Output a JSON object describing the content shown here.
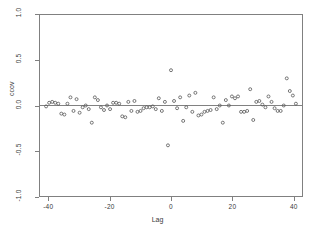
{
  "chart_data": {
    "type": "scatter",
    "title": "",
    "xlabel": "Lag",
    "ylabel": "ccov",
    "xlim": [
      -43,
      43
    ],
    "ylim": [
      -1.0,
      1.0
    ],
    "xticks": [
      -40,
      -20,
      0,
      20,
      40
    ],
    "xtick_labels": [
      "-40",
      "-20",
      "0",
      "20",
      "40"
    ],
    "yticks": [
      -1.0,
      -0.5,
      0.0,
      0.5,
      1.0
    ],
    "ytick_labels": [
      "-1.0",
      "-0.5",
      "0.0",
      "0.5",
      "1.0"
    ],
    "grid": false,
    "legend": null,
    "marker": "open-circle",
    "marker_color": "#555555",
    "reference_line": {
      "orientation": "horizontal",
      "y": 0.0,
      "color": "#808080"
    },
    "series": [
      {
        "name": "ccov",
        "x": [
          -41,
          -40,
          -39,
          -38,
          -37,
          -36,
          -35,
          -34,
          -33,
          -32,
          -31,
          -30,
          -29,
          -28,
          -27,
          -26,
          -25,
          -24,
          -23,
          -22,
          -21,
          -20,
          -19,
          -18,
          -17,
          -16,
          -15,
          -14,
          -13,
          -12,
          -11,
          -10,
          -9,
          -8,
          -7,
          -6,
          -5,
          -4,
          -3,
          -2,
          -1,
          0,
          1,
          2,
          3,
          4,
          5,
          6,
          7,
          8,
          9,
          10,
          11,
          12,
          13,
          14,
          15,
          16,
          17,
          18,
          19,
          20,
          21,
          22,
          23,
          24,
          25,
          26,
          27,
          28,
          29,
          30,
          31,
          32,
          33,
          34,
          35,
          36,
          37,
          38,
          39,
          40,
          41
        ],
        "y": [
          -0.01,
          0.03,
          0.04,
          0.03,
          0.02,
          -0.09,
          -0.1,
          0.02,
          0.09,
          -0.06,
          0.07,
          -0.08,
          -0.02,
          0.0,
          -0.04,
          -0.19,
          0.09,
          0.06,
          -0.02,
          -0.05,
          0.0,
          -0.04,
          0.03,
          0.03,
          0.02,
          -0.12,
          -0.13,
          0.04,
          -0.06,
          0.05,
          -0.07,
          -0.06,
          -0.03,
          -0.02,
          -0.02,
          -0.01,
          -0.04,
          0.08,
          -0.06,
          0.04,
          -0.44,
          0.39,
          0.05,
          -0.03,
          0.09,
          -0.17,
          -0.02,
          0.11,
          -0.07,
          0.14,
          -0.11,
          -0.1,
          -0.07,
          -0.06,
          -0.05,
          0.09,
          -0.04,
          0.0,
          -0.19,
          0.06,
          0.0,
          0.1,
          0.08,
          0.1,
          -0.07,
          -0.07,
          -0.06,
          0.18,
          -0.16,
          0.04,
          0.05,
          0.01,
          -0.02,
          0.1,
          0.04,
          -0.03,
          -0.06,
          -0.06,
          0.0,
          0.3,
          0.16,
          0.11,
          0.02
        ]
      }
    ]
  }
}
